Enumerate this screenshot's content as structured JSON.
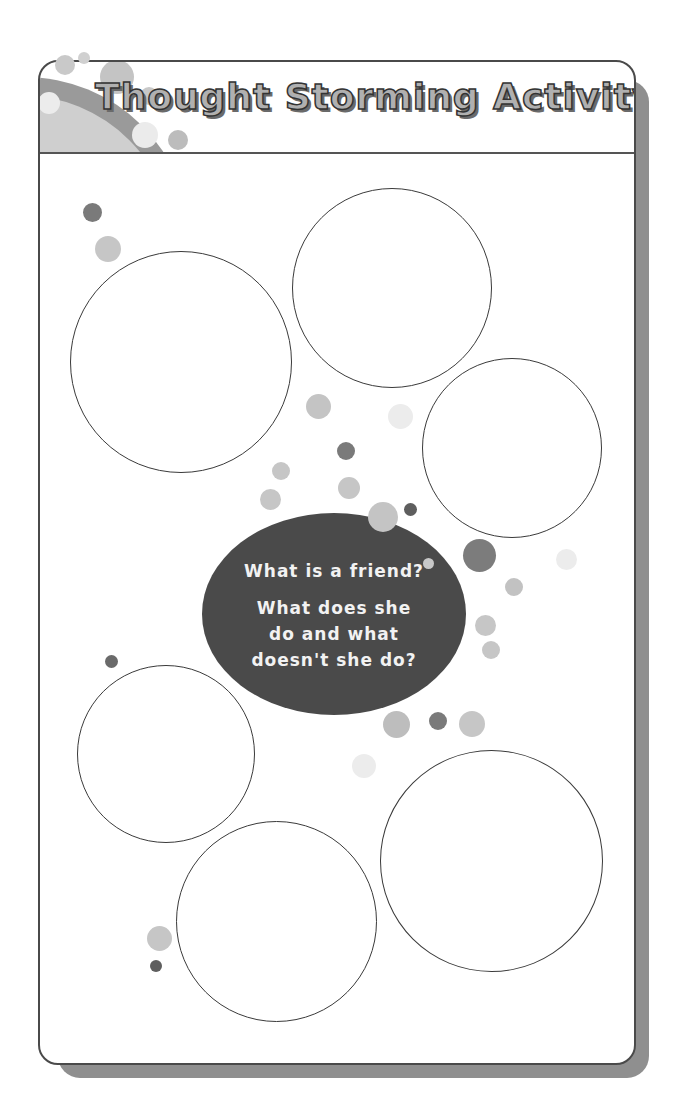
{
  "worksheet": {
    "title": "Thought Storming Activity",
    "center_prompt": {
      "question_1": "What is a friend?",
      "question_2": "What does she do and what doesn't she do?"
    },
    "answer_bubbles": [
      {
        "id": "top-left",
        "cx": 181,
        "cy": 362,
        "r": 111,
        "text": ""
      },
      {
        "id": "top-middle",
        "cx": 392,
        "cy": 288,
        "r": 100,
        "text": ""
      },
      {
        "id": "right",
        "cx": 512,
        "cy": 448,
        "r": 90,
        "text": ""
      },
      {
        "id": "lower-left",
        "cx": 166,
        "cy": 754,
        "r": 89,
        "text": ""
      },
      {
        "id": "bottom-middle",
        "cx": 276,
        "cy": 921,
        "r": 100,
        "text": ""
      },
      {
        "id": "bottom-right",
        "cx": 491,
        "cy": 861,
        "r": 111,
        "text": ""
      }
    ],
    "colors": {
      "border": "#4a4a4a",
      "shadow": "#8f8f8f",
      "oval": "#4a4a4a",
      "dot_dark": "#6e6e6e",
      "dot_mid": "#bdbdbd",
      "dot_light": "#e6e6e6"
    }
  }
}
